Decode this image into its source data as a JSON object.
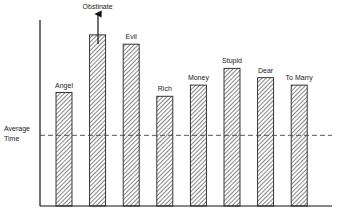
{
  "chart_data": {
    "type": "bar",
    "title": "",
    "xlabel": "",
    "ylabel": "",
    "categories": [
      "Angel",
      "Obstinate",
      "Evil",
      "Rich",
      "Money",
      "Stupid",
      "Dear",
      "To Marry"
    ],
    "values": [
      61,
      92,
      87,
      59,
      65,
      74,
      69,
      65
    ],
    "ylim": [
      0,
      100
    ],
    "grid": false,
    "legend": null,
    "annotations": [
      {
        "text": "Average Time",
        "type": "dashed-reference-line",
        "value": 38
      },
      {
        "text": "Obstinate",
        "type": "upward-arrow",
        "note": "bar extends beyond plotted range"
      }
    ],
    "reference_line": {
      "label_line1": "Average",
      "label_line2": "Time",
      "value": 38
    },
    "bar_fill": "diagonal-hatch",
    "colors": {
      "bar_stroke": "#222222",
      "hatch": "#333333",
      "axis": "#111111",
      "dash": "#444444"
    }
  }
}
